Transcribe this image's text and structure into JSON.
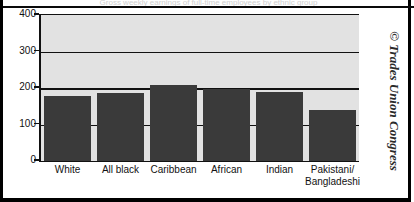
{
  "figure": {
    "clipped_title": "Gross weekly earnings of full-time employees by ethnic group",
    "copyright": "© Trades Union Congress",
    "copyright_symbol": "©"
  },
  "chart_data": {
    "type": "bar",
    "title": "",
    "xlabel": "",
    "ylabel": "",
    "categories": [
      "White",
      "All black",
      "Caribbean",
      "African",
      "Indian",
      "Pakistani/\nBangladeshi"
    ],
    "values": [
      178,
      185,
      207,
      197,
      190,
      140
    ],
    "ylim": [
      0,
      400
    ],
    "yticks": [
      0,
      100,
      200,
      300,
      400
    ],
    "ytick_labels": [
      "0",
      "100",
      "200",
      "300",
      "400"
    ],
    "gridlines": [
      100,
      200,
      300,
      400
    ],
    "grid": true,
    "legend": null,
    "legend_position": "none",
    "bar_color": "#3a3a3a",
    "plot_background": "#e2e2e2",
    "axis_color": "#111111"
  }
}
